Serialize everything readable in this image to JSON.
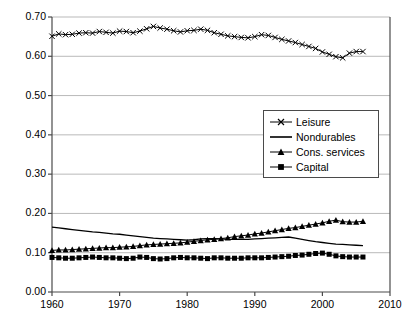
{
  "chart_data": {
    "type": "line",
    "title": "",
    "xlabel": "",
    "ylabel": "",
    "xlim": [
      1960,
      2010
    ],
    "ylim": [
      0.0,
      0.7
    ],
    "xticks": [
      1960,
      1970,
      1980,
      1990,
      2000,
      2010
    ],
    "xtick_labels": [
      "1960",
      "1970",
      "1980",
      "1990",
      "2000",
      "2010"
    ],
    "yticks": [
      0.0,
      0.1,
      0.2,
      0.3,
      0.4,
      0.5,
      0.6,
      0.7
    ],
    "ytick_labels": [
      "0.00",
      "0.10",
      "0.20",
      "0.30",
      "0.40",
      "0.50",
      "0.60",
      "0.70"
    ],
    "grid": true,
    "grid_color": "#b9b9b9",
    "axis_color": "#4a4a4a",
    "series_color": "#000000",
    "legend_position": "center-right",
    "x": [
      1960,
      1961,
      1962,
      1963,
      1964,
      1965,
      1966,
      1967,
      1968,
      1969,
      1970,
      1971,
      1972,
      1973,
      1974,
      1975,
      1976,
      1977,
      1978,
      1979,
      1980,
      1981,
      1982,
      1983,
      1984,
      1985,
      1986,
      1987,
      1988,
      1989,
      1990,
      1991,
      1992,
      1993,
      1994,
      1995,
      1996,
      1997,
      1998,
      1999,
      2000,
      2001,
      2002,
      2003,
      2004,
      2005,
      2006
    ],
    "series": [
      {
        "name": "Leisure",
        "marker": "x",
        "values": [
          0.651,
          0.657,
          0.655,
          0.656,
          0.659,
          0.66,
          0.659,
          0.663,
          0.661,
          0.659,
          0.664,
          0.663,
          0.66,
          0.664,
          0.67,
          0.676,
          0.672,
          0.669,
          0.665,
          0.662,
          0.665,
          0.666,
          0.669,
          0.666,
          0.66,
          0.656,
          0.652,
          0.65,
          0.648,
          0.647,
          0.65,
          0.655,
          0.653,
          0.648,
          0.643,
          0.639,
          0.635,
          0.63,
          0.625,
          0.62,
          0.611,
          0.605,
          0.599,
          0.596,
          0.608,
          0.612,
          0.612
        ]
      },
      {
        "name": "Nondurables",
        "marker": "none",
        "values": [
          0.165,
          0.163,
          0.161,
          0.159,
          0.157,
          0.155,
          0.153,
          0.152,
          0.15,
          0.148,
          0.147,
          0.145,
          0.143,
          0.141,
          0.139,
          0.137,
          0.136,
          0.135,
          0.134,
          0.133,
          0.132,
          0.133,
          0.135,
          0.136,
          0.136,
          0.135,
          0.134,
          0.134,
          0.134,
          0.134,
          0.135,
          0.136,
          0.137,
          0.138,
          0.139,
          0.14,
          0.137,
          0.134,
          0.131,
          0.128,
          0.126,
          0.124,
          0.122,
          0.121,
          0.12,
          0.119,
          0.118
        ]
      },
      {
        "name": "Cons. services",
        "marker": "triangle",
        "values": [
          0.106,
          0.107,
          0.107,
          0.108,
          0.109,
          0.11,
          0.111,
          0.112,
          0.113,
          0.113,
          0.114,
          0.115,
          0.116,
          0.118,
          0.12,
          0.121,
          0.122,
          0.123,
          0.124,
          0.125,
          0.127,
          0.129,
          0.131,
          0.133,
          0.134,
          0.136,
          0.138,
          0.141,
          0.143,
          0.145,
          0.148,
          0.15,
          0.153,
          0.156,
          0.159,
          0.162,
          0.164,
          0.167,
          0.17,
          0.173,
          0.176,
          0.18,
          0.183,
          0.179,
          0.178,
          0.178,
          0.18
        ]
      },
      {
        "name": "Capital",
        "marker": "square",
        "values": [
          0.088,
          0.087,
          0.086,
          0.086,
          0.087,
          0.088,
          0.089,
          0.088,
          0.087,
          0.087,
          0.086,
          0.085,
          0.086,
          0.089,
          0.088,
          0.085,
          0.084,
          0.085,
          0.087,
          0.088,
          0.087,
          0.087,
          0.086,
          0.085,
          0.087,
          0.087,
          0.086,
          0.086,
          0.086,
          0.087,
          0.087,
          0.087,
          0.088,
          0.089,
          0.09,
          0.091,
          0.093,
          0.094,
          0.096,
          0.098,
          0.099,
          0.096,
          0.092,
          0.09,
          0.089,
          0.089,
          0.089
        ]
      }
    ]
  },
  "legend": {
    "items": [
      {
        "label": "Leisure",
        "marker": "x-marker"
      },
      {
        "label": "Nondurables",
        "marker": "line-marker"
      },
      {
        "label": "Cons. services",
        "marker": "triangle-marker"
      },
      {
        "label": "Capital",
        "marker": "square-marker"
      }
    ]
  }
}
